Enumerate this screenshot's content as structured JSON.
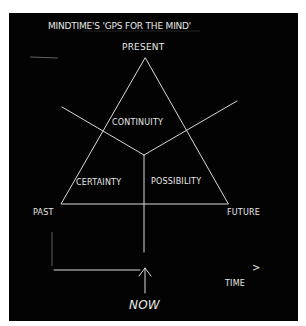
{
  "diagram": {
    "title": "MINDTIME'S 'GPS FOR THE MIND'",
    "vertex_labels": {
      "top": "PRESENT",
      "left": "PAST",
      "right": "FUTURE"
    },
    "region_labels": {
      "top": "CONTINUITY",
      "left": "CERTAINTY",
      "right": "POSSIBILITY"
    },
    "timeline": {
      "axis_label": "TIME",
      "axis_arrow": ">",
      "marker_label": "NOW",
      "marker_icon": "up-arrow-icon"
    },
    "colors": {
      "board": "#030303",
      "chalk": "#e8e8e8",
      "background": "#ffffff"
    }
  }
}
